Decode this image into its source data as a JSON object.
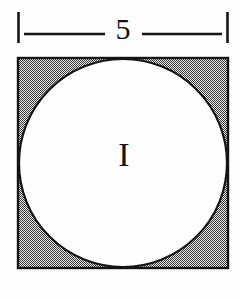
{
  "figure": {
    "background_color": "#fdfdfd",
    "ink_color": "#141414",
    "shade_color": "#8f8f8f"
  },
  "dimension": {
    "name": "top-width-dimension",
    "value_label": "5",
    "left_tick": {
      "x": 18,
      "y_top": 12,
      "y_bottom": 43
    },
    "right_tick": {
      "x": 228,
      "y_top": 12,
      "y_bottom": 43
    },
    "line_y": 34,
    "left_segment": {
      "x_start": 24,
      "x_end": 105
    },
    "right_segment": {
      "x_start": 142,
      "x_end": 222
    },
    "label_position": {
      "x": 123,
      "y": 32
    }
  },
  "square": {
    "name": "outer-square",
    "x": 18,
    "y": 58,
    "side": 210,
    "fill_description": "50% checkerboard dither gray",
    "stroke_color": "#141414"
  },
  "circle": {
    "name": "inscribed-circle",
    "cx": 123,
    "cy": 163,
    "r": 104,
    "fill_color": "#fefefe",
    "stroke_color": "#141414"
  },
  "region_label": {
    "name": "region-I-label",
    "text": "I",
    "x": 124,
    "y": 158
  }
}
